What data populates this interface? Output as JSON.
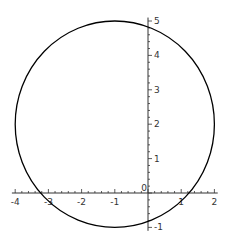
{
  "chart_data": {
    "type": "line",
    "title": "",
    "xlabel": "",
    "ylabel": "",
    "series": [
      {
        "name": "circle",
        "center": [
          -1,
          2
        ],
        "radius": 3,
        "color": "#000000"
      }
    ],
    "x_ticks": [
      "-4",
      "-3",
      "-2",
      "-1",
      "0",
      "1",
      "2"
    ],
    "y_ticks": [
      "-1",
      "1",
      "2",
      "3",
      "4",
      "5"
    ],
    "xlim": [
      -4.1,
      2.1
    ],
    "ylim": [
      -1.1,
      5.1
    ],
    "grid": false,
    "legend": null
  }
}
